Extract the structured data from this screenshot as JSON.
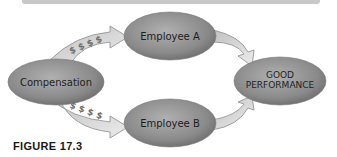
{
  "nodes": {
    "compensation": "Compensation",
    "employee_a": "Employee A",
    "employee_b": "Employee B",
    "good_performance_line1": "GOOD",
    "good_performance_line2": "PERFORMANCE"
  },
  "arrows": {
    "comp_to_a_symbols": "$ $ $ $",
    "comp_to_b_symbols": "$ $ $ $"
  },
  "caption": {
    "figure_label": "FIGURE 17.3"
  },
  "colors": {
    "node_fill": "#8a8a8a",
    "arrow_fill": "#d8d8d8",
    "top_bar": "#c8c8c8"
  }
}
